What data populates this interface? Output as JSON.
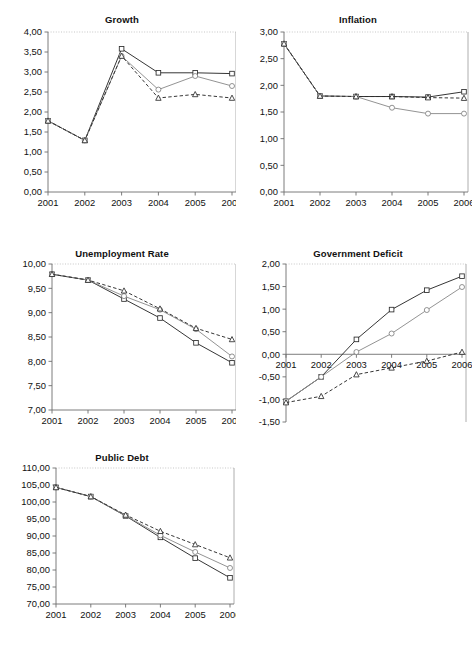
{
  "document": {
    "title": "Economic Indicators Scenario Charts",
    "decimal_separator": ",",
    "years": [
      "2001",
      "2002",
      "2003",
      "2004",
      "2005",
      "2006"
    ]
  },
  "series_styles": [
    {
      "key": "square",
      "marker": "square",
      "line": "solid",
      "tone": "dark"
    },
    {
      "key": "circle",
      "marker": "circle",
      "line": "solid",
      "tone": "light"
    },
    {
      "key": "triangle",
      "marker": "triangle",
      "line": "dashed",
      "tone": "dark"
    }
  ],
  "charts": {
    "growth": {
      "title": "Growth"
    },
    "inflation": {
      "title": "Inflation"
    },
    "unemployment": {
      "title": "Unemployment Rate"
    },
    "deficit": {
      "title": "Government Deficit"
    },
    "debt": {
      "title": "Public Debt"
    }
  },
  "chart_data": [
    {
      "id": "growth",
      "type": "line",
      "title": "Growth",
      "xlabel": "",
      "ylabel": "",
      "x": [
        2001,
        2002,
        2003,
        2004,
        2005,
        2006
      ],
      "categories": [
        "2001",
        "2002",
        "2003",
        "2004",
        "2005",
        "2006"
      ],
      "ylim": [
        0.0,
        4.0
      ],
      "ytick_step": 0.5,
      "ytick_labels": [
        "0,00",
        "0,50",
        "1,00",
        "1,50",
        "2,00",
        "2,50",
        "3,00",
        "3,50",
        "4,00"
      ],
      "grid": false,
      "legend": "none",
      "series": [
        {
          "name": "square",
          "values": [
            1.78,
            1.29,
            3.58,
            2.98,
            2.98,
            2.96
          ]
        },
        {
          "name": "circle",
          "values": [
            1.78,
            1.29,
            3.4,
            2.56,
            2.9,
            2.65
          ]
        },
        {
          "name": "triangle",
          "values": [
            1.78,
            1.29,
            3.4,
            2.35,
            2.44,
            2.35
          ]
        }
      ]
    },
    {
      "id": "inflation",
      "type": "line",
      "title": "Inflation",
      "xlabel": "",
      "ylabel": "",
      "x": [
        2001,
        2002,
        2003,
        2004,
        2005,
        2006
      ],
      "categories": [
        "2001",
        "2002",
        "2003",
        "2004",
        "2005",
        "2006"
      ],
      "ylim": [
        0.0,
        3.0
      ],
      "ytick_step": 0.5,
      "ytick_labels": [
        "0,00",
        "0,50",
        "1,00",
        "1,50",
        "2,00",
        "2,50",
        "3,00"
      ],
      "grid": false,
      "legend": "none",
      "series": [
        {
          "name": "square",
          "values": [
            2.78,
            1.8,
            1.79,
            1.79,
            1.78,
            1.88
          ]
        },
        {
          "name": "circle",
          "values": [
            2.78,
            1.8,
            1.79,
            1.58,
            1.47,
            1.47
          ]
        },
        {
          "name": "triangle",
          "values": [
            2.78,
            1.8,
            1.79,
            1.79,
            1.77,
            1.76
          ]
        }
      ]
    },
    {
      "id": "unemployment",
      "type": "line",
      "title": "Unemployment Rate",
      "xlabel": "",
      "ylabel": "",
      "x": [
        2001,
        2002,
        2003,
        2004,
        2005,
        2006
      ],
      "categories": [
        "2001",
        "2002",
        "2003",
        "2004",
        "2005",
        "2006"
      ],
      "ylim": [
        7.0,
        10.0
      ],
      "ytick_step": 0.5,
      "ytick_labels": [
        "7,00",
        "7,50",
        "8,00",
        "8,50",
        "9,00",
        "9,50",
        "10,00"
      ],
      "grid": false,
      "legend": "none",
      "series": [
        {
          "name": "square",
          "values": [
            9.79,
            9.67,
            9.28,
            8.89,
            8.38,
            7.97
          ]
        },
        {
          "name": "circle",
          "values": [
            9.79,
            9.67,
            9.34,
            9.06,
            8.66,
            8.1
          ]
        },
        {
          "name": "triangle",
          "values": [
            9.79,
            9.67,
            9.45,
            9.08,
            8.68,
            8.45
          ]
        }
      ]
    },
    {
      "id": "deficit",
      "type": "line",
      "title": "Government Deficit",
      "xlabel": "",
      "ylabel": "",
      "x": [
        2001,
        2002,
        2003,
        2004,
        2005,
        2006
      ],
      "categories": [
        "2001",
        "2002",
        "2003",
        "2004",
        "2005",
        "2006"
      ],
      "ylim": [
        -1.5,
        2.0
      ],
      "ytick_step": 0.5,
      "ytick_labels": [
        "-1,50",
        "-1,00",
        "-0,50",
        "0,00",
        "0,50",
        "1,00",
        "1,50",
        "2,00"
      ],
      "grid": false,
      "legend": "none",
      "zero_line": true,
      "series": [
        {
          "name": "square",
          "values": [
            -1.04,
            -0.5,
            0.33,
            0.99,
            1.42,
            1.73
          ]
        },
        {
          "name": "circle",
          "values": [
            -1.04,
            -0.5,
            0.05,
            0.46,
            0.98,
            1.49
          ]
        },
        {
          "name": "triangle",
          "values": [
            -1.07,
            -0.93,
            -0.45,
            -0.3,
            -0.15,
            0.05
          ]
        }
      ]
    },
    {
      "id": "debt",
      "type": "line",
      "title": "Public Debt",
      "xlabel": "",
      "ylabel": "",
      "x": [
        2001,
        2002,
        2003,
        2004,
        2005,
        2006
      ],
      "categories": [
        "2001",
        "2002",
        "2003",
        "2004",
        "2005",
        "2006"
      ],
      "ylim": [
        70.0,
        110.0
      ],
      "ytick_step": 5.0,
      "ytick_labels": [
        "70,00",
        "75,00",
        "80,00",
        "85,00",
        "90,00",
        "95,00",
        "100,00",
        "105,00",
        "110,00"
      ],
      "grid": false,
      "legend": "none",
      "series": [
        {
          "name": "square",
          "values": [
            104.3,
            101.6,
            95.9,
            89.6,
            83.5,
            77.7
          ]
        },
        {
          "name": "circle",
          "values": [
            104.3,
            101.6,
            96.0,
            90.2,
            85.3,
            80.6
          ]
        },
        {
          "name": "triangle",
          "values": [
            104.3,
            101.6,
            96.2,
            91.4,
            87.5,
            83.6
          ]
        }
      ]
    }
  ]
}
